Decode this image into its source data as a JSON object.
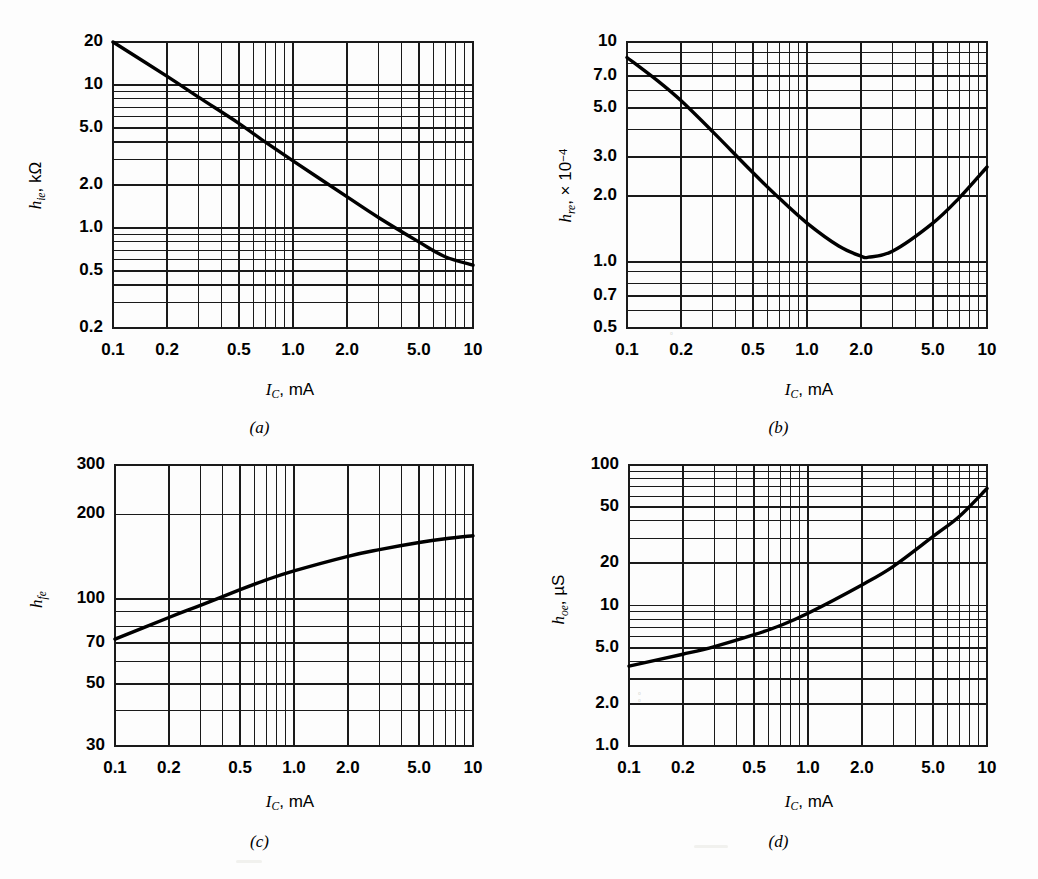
{
  "figure": {
    "background_color": "#fdfdfd",
    "line_color": "#000000",
    "grid_color": "#1a1a1a",
    "panel_count": 4
  },
  "panels": [
    {
      "id": "a",
      "caption": "(a)",
      "x_axis_label_symbol": "I",
      "x_axis_label_sub": "C",
      "x_axis_label_unit": ", mA",
      "y_axis_label_symbol": "h",
      "y_axis_label_sub": "ie",
      "y_axis_label_unit": ", kΩ",
      "x_ticks": [
        "0.1",
        "0.2",
        "0.5",
        "1.0",
        "2.0",
        "5.0",
        "10"
      ],
      "y_ticks": [
        "0.2",
        "0.5",
        "1.0",
        "2.0",
        "5.0",
        "10",
        "20"
      ]
    },
    {
      "id": "b",
      "caption": "(b)",
      "x_axis_label_symbol": "I",
      "x_axis_label_sub": "C",
      "x_axis_label_unit": ", mA",
      "y_axis_label_symbol": "h",
      "y_axis_label_sub": "re",
      "y_axis_label_unit": ", × 10",
      "y_axis_label_sup": "−4",
      "x_ticks": [
        "0.1",
        "0.2",
        "0.5",
        "1.0",
        "2.0",
        "5.0",
        "10"
      ],
      "y_ticks": [
        "0.5",
        "0.7",
        "1.0",
        "2.0",
        "3.0",
        "5.0",
        "7.0",
        "10"
      ]
    },
    {
      "id": "c",
      "caption": "(c)",
      "x_axis_label_symbol": "I",
      "x_axis_label_sub": "C",
      "x_axis_label_unit": ", mA",
      "y_axis_label_symbol": "h",
      "y_axis_label_sub": "fe",
      "y_axis_label_unit": "",
      "x_ticks": [
        "0.1",
        "0.2",
        "0.5",
        "1.0",
        "2.0",
        "5.0",
        "10"
      ],
      "y_ticks": [
        "30",
        "50",
        "70",
        "100",
        "200",
        "300"
      ]
    },
    {
      "id": "d",
      "caption": "(d)",
      "x_axis_label_symbol": "I",
      "x_axis_label_sub": "C",
      "x_axis_label_unit": ", mA",
      "y_axis_label_symbol": "h",
      "y_axis_label_sub": "oe",
      "y_axis_label_unit": ", μS",
      "x_ticks": [
        "0.1",
        "0.2",
        "0.5",
        "1.0",
        "2.0",
        "5.0",
        "10"
      ],
      "y_ticks": [
        "1.0",
        "2.0",
        "5.0",
        "10",
        "20",
        "50",
        "100"
      ]
    }
  ],
  "chart_data": [
    {
      "type": "line",
      "panel": "a",
      "title": "",
      "xlabel": "I_C, mA",
      "ylabel": "h_ie, kΩ",
      "xscale": "log",
      "yscale": "log",
      "xlim": [
        0.1,
        10
      ],
      "ylim": [
        0.2,
        20
      ],
      "grid": true,
      "legend": "none",
      "xticks": [
        0.1,
        0.2,
        0.5,
        1.0,
        2.0,
        5.0,
        10
      ],
      "yticks": [
        0.2,
        0.5,
        1.0,
        2.0,
        5.0,
        10,
        20
      ],
      "x": [
        0.1,
        0.2,
        0.3,
        0.5,
        0.7,
        1.0,
        2.0,
        3.0,
        5.0,
        7.0,
        10
      ],
      "y": [
        20.0,
        11.5,
        8.2,
        5.4,
        4.0,
        2.95,
        1.65,
        1.18,
        0.8,
        0.63,
        0.55
      ]
    },
    {
      "type": "line",
      "panel": "b",
      "title": "",
      "xlabel": "I_C, mA",
      "ylabel": "h_re, × 10^-4",
      "xscale": "log",
      "yscale": "log",
      "xlim": [
        0.1,
        10
      ],
      "ylim": [
        0.5,
        10
      ],
      "grid": true,
      "legend": "none",
      "xticks": [
        0.1,
        0.2,
        0.5,
        1.0,
        2.0,
        5.0,
        10
      ],
      "yticks": [
        0.5,
        0.7,
        1.0,
        2.0,
        3.0,
        5.0,
        7.0,
        10
      ],
      "x": [
        0.1,
        0.15,
        0.2,
        0.3,
        0.5,
        0.7,
        1.0,
        1.5,
        2.0,
        2.2,
        3.0,
        5.0,
        7.0,
        10
      ],
      "y": [
        8.5,
        6.6,
        5.4,
        3.9,
        2.55,
        1.95,
        1.5,
        1.18,
        1.06,
        1.05,
        1.12,
        1.5,
        1.95,
        2.7
      ]
    },
    {
      "type": "line",
      "panel": "c",
      "title": "",
      "xlabel": "I_C, mA",
      "ylabel": "h_fe",
      "xscale": "log",
      "yscale": "log",
      "xlim": [
        0.1,
        10
      ],
      "ylim": [
        30,
        300
      ],
      "grid": true,
      "legend": "none",
      "xticks": [
        0.1,
        0.2,
        0.5,
        1.0,
        2.0,
        5.0,
        10
      ],
      "yticks": [
        30,
        50,
        70,
        100,
        200,
        300
      ],
      "x": [
        0.1,
        0.2,
        0.3,
        0.5,
        0.7,
        1.0,
        2.0,
        3.0,
        5.0,
        7.0,
        10
      ],
      "y": [
        72,
        86,
        95,
        108,
        117,
        126,
        142,
        150,
        159,
        164,
        168
      ]
    },
    {
      "type": "line",
      "panel": "d",
      "title": "",
      "xlabel": "I_C, mA",
      "ylabel": "h_oe, μS",
      "xscale": "log",
      "yscale": "log",
      "xlim": [
        0.1,
        10
      ],
      "ylim": [
        1.0,
        100
      ],
      "grid": true,
      "legend": "none",
      "xticks": [
        0.1,
        0.2,
        0.5,
        1.0,
        2.0,
        5.0,
        10
      ],
      "yticks": [
        1.0,
        2.0,
        5.0,
        10,
        20,
        50,
        100
      ],
      "x": [
        0.1,
        0.2,
        0.3,
        0.5,
        0.7,
        1.0,
        2.0,
        3.0,
        5.0,
        7.0,
        10
      ],
      "y": [
        3.7,
        4.5,
        5.1,
        6.2,
        7.2,
        8.8,
        14.0,
        19.0,
        31.0,
        43.0,
        68.0
      ]
    }
  ]
}
